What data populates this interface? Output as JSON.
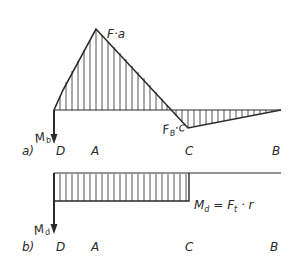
{
  "diagram_a": {
    "tag": "a)",
    "points": [
      "D",
      "A",
      "C",
      "B"
    ],
    "peak_label": "F·a",
    "valley_label_main": "F",
    "valley_label_sub": "B",
    "valley_label_tail": "·c",
    "moment_label_main": "M",
    "moment_label_sub": "b"
  },
  "diagram_b": {
    "tag": "b)",
    "points": [
      "D",
      "A",
      "C",
      "B"
    ],
    "moment_label_main": "M",
    "moment_label_sub": "d",
    "equation": {
      "lhs_main": "M",
      "lhs_sub": "d",
      "eq": " = ",
      "f_main": "F",
      "f_sub": "t",
      "tail": " · r"
    }
  },
  "colors": {
    "ink": "#2a2a2a",
    "background": "#ffffff"
  }
}
